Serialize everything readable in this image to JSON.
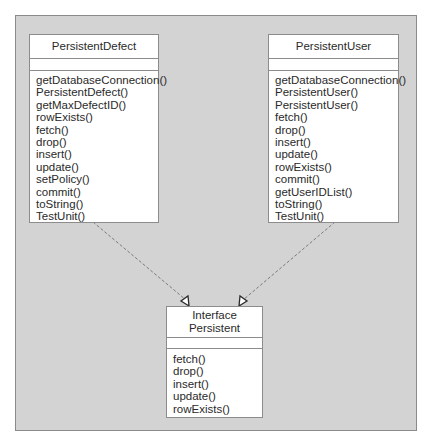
{
  "diagram": {
    "type": "uml-class-diagram",
    "classes": {
      "defect": {
        "name": "PersistentDefect",
        "attributes": [],
        "methods": [
          "getDatabaseConnection()",
          "PersistentDefect()",
          "getMaxDefectID()",
          "rowExists()",
          "fetch()",
          "drop()",
          "insert()",
          "update()",
          "setPolicy()",
          "commit()",
          "toString()",
          "TestUnit()"
        ]
      },
      "user": {
        "name": "PersistentUser",
        "attributes": [],
        "methods": [
          "getDatabaseConnection()",
          "PersistentUser()",
          "PersistentUser()",
          "fetch()",
          "drop()",
          "insert()",
          "update()",
          "rowExists()",
          "commit()",
          "getUserIDList()",
          "toString()",
          "TestUnit()"
        ]
      },
      "interface": {
        "stereotype": "Interface",
        "name": "Persistent",
        "attributes": [],
        "methods": [
          "fetch()",
          "drop()",
          "insert()",
          "update()",
          "rowExists()"
        ]
      }
    },
    "relationships": [
      {
        "from": "PersistentDefect",
        "to": "Persistent",
        "kind": "realization",
        "style": "dashed",
        "arrowhead": "hollow-triangle"
      },
      {
        "from": "PersistentUser",
        "to": "Persistent",
        "kind": "realization",
        "style": "dashed",
        "arrowhead": "hollow-triangle"
      }
    ],
    "colors": {
      "canvas": "#d3d3d3",
      "box_fill": "#ffffff",
      "border": "#8c8c8c",
      "text": "#2a2a2a",
      "connector": "#7a7a7a"
    }
  }
}
